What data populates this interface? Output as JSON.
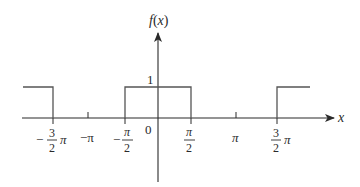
{
  "diagram": {
    "type": "square-wave-plot",
    "function_label": "f(x)",
    "function_label_parts": {
      "f": "f",
      "open": "(",
      "var": "x",
      "close": ")"
    },
    "x_axis_label": "x",
    "y_tick_label": "1",
    "origin_label": "0",
    "x_ticks": [
      {
        "id": "neg-3pi-2",
        "value": "-3π/2",
        "numerator": "3",
        "denominator": "2",
        "sign": "−",
        "suffix": "π",
        "form": "fraction-coefficient"
      },
      {
        "id": "neg-pi",
        "value": "-π",
        "text": "−π",
        "form": "plain"
      },
      {
        "id": "neg-pi-2",
        "value": "-π/2",
        "numerator": "π",
        "denominator": "2",
        "sign": "−",
        "form": "fraction"
      },
      {
        "id": "pi-2",
        "value": "π/2",
        "numerator": "π",
        "denominator": "2",
        "sign": "",
        "form": "fraction"
      },
      {
        "id": "pi",
        "value": "π",
        "text": "π",
        "form": "plain"
      },
      {
        "id": "3pi-2",
        "value": "3π/2",
        "numerator": "3",
        "denominator": "2",
        "sign": "",
        "suffix": "π",
        "form": "fraction-coefficient"
      }
    ],
    "pulses": [
      {
        "from": "< -3π/2",
        "to": "-3π/2",
        "height": 1
      },
      {
        "from": "-π/2",
        "to": "π/2",
        "height": 1
      },
      {
        "from": "3π/2",
        "to": "> 3π/2",
        "height": 1
      }
    ],
    "colors": {
      "axis": "#2a2a2a",
      "wave": "#555555",
      "text": "#2a2a2a"
    }
  }
}
